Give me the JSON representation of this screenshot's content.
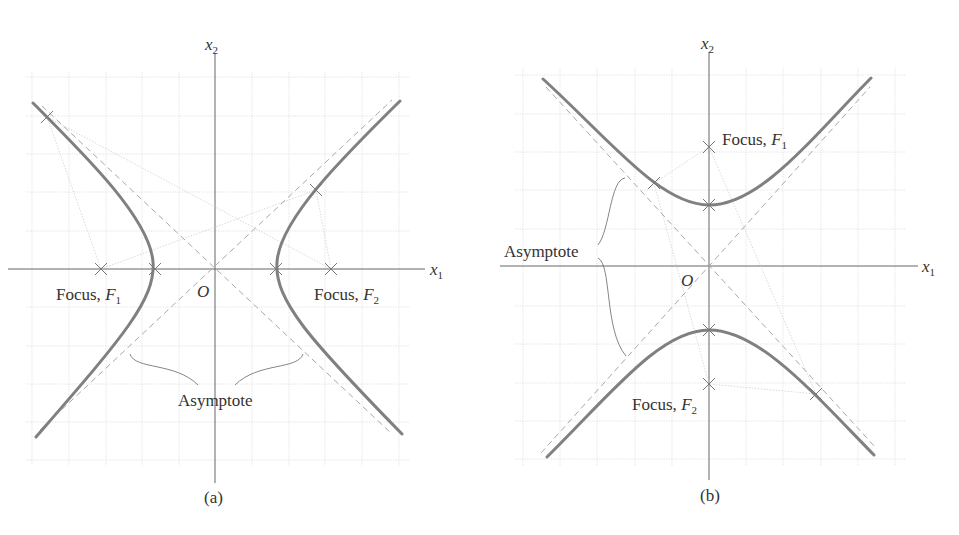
{
  "figure": {
    "panels": [
      {
        "id": "a",
        "caption": "(a)",
        "orientation": "horizontal-transverse-axis",
        "axis_x_label": "x",
        "axis_x_sub": "1",
        "axis_y_label": "x",
        "axis_y_sub": "2",
        "origin_label": "O",
        "focus_left_label": "Focus, ",
        "focus_left_sym": "F",
        "focus_left_sub": "1",
        "focus_right_label": "Focus, ",
        "focus_right_sym": "F",
        "focus_right_sub": "2",
        "asymptote_label": "Asymptote"
      },
      {
        "id": "b",
        "caption": "(b)",
        "orientation": "vertical-transverse-axis",
        "axis_x_label": "x",
        "axis_x_sub": "1",
        "axis_y_label": "x",
        "axis_y_sub": "2",
        "origin_label": "O",
        "focus_top_label": "Focus, ",
        "focus_top_sym": "F",
        "focus_top_sub": "1",
        "focus_bottom_label": "Focus, ",
        "focus_bottom_sym": "F",
        "focus_bottom_sub": "2",
        "asymptote_label": "Asymptote"
      }
    ],
    "colors": {
      "curve": "#7a7a7a",
      "asymptote": "#9a9a9a",
      "grid": "#d9d9d9",
      "axis": "#555555",
      "focal_lines": "#c8c8c8",
      "text": "#333333"
    }
  }
}
